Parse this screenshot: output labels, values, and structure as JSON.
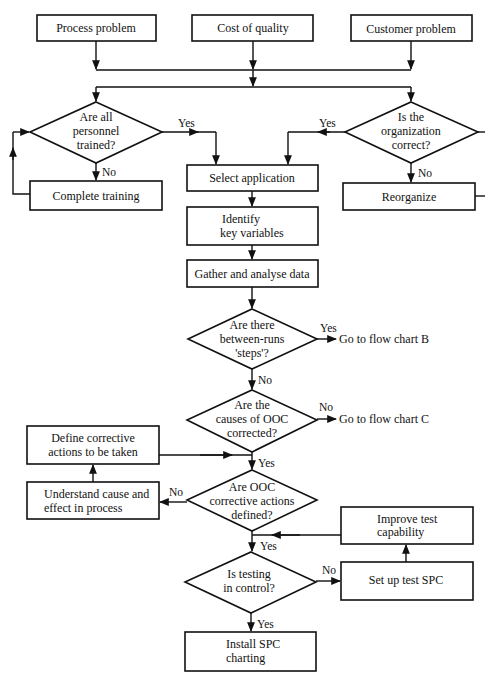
{
  "diagram": {
    "type": "flowchart",
    "colors": {
      "stroke": "#111111",
      "background": "#ffffff",
      "text": "#111111"
    },
    "start_boxes": [
      {
        "id": "process_problem",
        "label": "Process problem"
      },
      {
        "id": "cost_of_quality",
        "label": "Cost of quality"
      },
      {
        "id": "customer_problem",
        "label": "Customer problem"
      }
    ],
    "decisions": {
      "personnel_trained": {
        "lines": [
          "Are all",
          "personnel",
          "trained?"
        ],
        "yes": "Yes",
        "no": "No"
      },
      "organization_correct": {
        "lines": [
          "Is the",
          "organization",
          "correct?"
        ],
        "yes": "Yes",
        "no": "No"
      },
      "between_runs_steps": {
        "lines": [
          "Are there",
          "between-runs",
          "'steps'?"
        ],
        "yes": "Yes",
        "no": "No"
      },
      "ooc_causes_corrected": {
        "lines": [
          "Are the",
          "causes of OOC",
          "corrected?"
        ],
        "yes": "Yes",
        "no": "No"
      },
      "ooc_actions_defined": {
        "lines": [
          "Are OOC",
          "corrective actions",
          "defined?"
        ],
        "yes": "Yes",
        "no": "No"
      },
      "testing_in_control": {
        "lines": [
          "Is testing",
          "in control?"
        ],
        "yes": "Yes",
        "no": "No"
      }
    },
    "processes": {
      "complete_training": {
        "lines": [
          "Complete training"
        ]
      },
      "reorganize": {
        "lines": [
          "Reorganize"
        ]
      },
      "select_application": {
        "lines": [
          "Select application"
        ]
      },
      "identify_key_variables": {
        "lines": [
          "Identify",
          "key variables"
        ]
      },
      "gather_analyse_data": {
        "lines": [
          "Gather and analyse data"
        ]
      },
      "define_corrective_actions": {
        "lines": [
          "Define corrective",
          "actions to be taken"
        ]
      },
      "understand_cause_effect": {
        "lines": [
          "Understand cause and",
          "effect in process"
        ]
      },
      "improve_test_capability": {
        "lines": [
          "Improve test",
          "capability"
        ]
      },
      "set_up_test_spc": {
        "lines": [
          "Set up test SPC"
        ]
      },
      "install_spc_charting": {
        "lines": [
          "Install SPC",
          "charting"
        ]
      }
    },
    "terminals": {
      "flow_chart_b": "Go to flow chart B",
      "flow_chart_c": "Go to flow chart C"
    }
  }
}
